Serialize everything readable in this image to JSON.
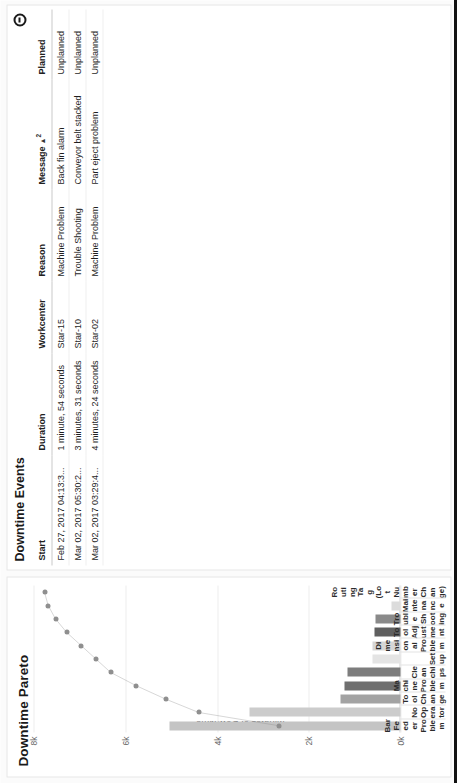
{
  "chart_panel": {
    "title": "Downtime Pareto",
    "y_axis_title": "Minutes of Downtime"
  },
  "chart_data": {
    "type": "bar",
    "title": "Downtime Pareto",
    "xlabel": "",
    "ylabel": "Minutes of Downtime",
    "ylim": [
      0,
      8000
    ],
    "yticks": [
      "0k",
      "2k",
      "4k",
      "6k",
      "8k"
    ],
    "ytick_values": [
      0,
      2000,
      4000,
      6000,
      8000
    ],
    "grid": true,
    "legend": "none",
    "categories": [
      "Bar Feeder Problem",
      "No Operator",
      "Tool Change",
      "Machine Problem",
      "Clean chips",
      "Setup",
      "Dimensional Problem",
      "Tool Adjustment",
      "Trouble Shooting",
      "Maintenance",
      "Routing Tag (Lot Number Change)"
    ],
    "series": [
      {
        "name": "Minutes of Downtime",
        "type": "bar",
        "values": [
          5040,
          3300,
          1300,
          1220,
          1160,
          620,
          600,
          560,
          540,
          190,
          20
        ],
        "colors": [
          "#c4c4c4",
          "#cccccc",
          "#a3a3a3",
          "#6f6f6f",
          "#7d7d7d",
          "#e4e4e4",
          "#d6d6d6",
          "#5f5f5f",
          "#8a8a8a",
          "#dcdcdc",
          "#efefef"
        ]
      },
      {
        "name": "Cumulative",
        "type": "line",
        "marker": "circle",
        "line_color": "#8c8c8c",
        "marker_color": "#8f8f8f",
        "values_pct": [
          33,
          55,
          64,
          72,
          79,
          83,
          87,
          91,
          94,
          96,
          97
        ]
      }
    ]
  },
  "table_panel": {
    "title": "Downtime Events",
    "collapse_icon": "minus-circle-icon",
    "columns": [
      {
        "key": "start",
        "label": "Start",
        "sorted": false
      },
      {
        "key": "duration",
        "label": "Duration",
        "sorted": false
      },
      {
        "key": "workcenter",
        "label": "Workcenter",
        "sorted": false
      },
      {
        "key": "reason",
        "label": "Reason",
        "sorted": false
      },
      {
        "key": "message",
        "label": "Message",
        "sorted": true,
        "sort_dir": "▲",
        "sort_order": "2"
      },
      {
        "key": "planned",
        "label": "Planned",
        "sorted": false
      }
    ],
    "rows": [
      {
        "start": "Feb 27, 2017 04:13:3...",
        "duration": "1 minute, 54 seconds",
        "workcenter": "Star-15",
        "reason": "Machine Problem",
        "message": "Back fin alarm",
        "planned": "Unplanned"
      },
      {
        "start": "Mar 02, 2017 05:30:2...",
        "duration": "3 minutes, 31 seconds",
        "workcenter": "Star-10",
        "reason": "Trouble Shooting",
        "message": "Conveyor belt stacked",
        "planned": "Unplanned"
      },
      {
        "start": "Mar 02, 2017 03:29:4...",
        "duration": "4 minutes, 24 seconds",
        "workcenter": "Star-02",
        "reason": "Machine Problem",
        "message": "Part eject problem",
        "planned": "Unplanned"
      }
    ]
  }
}
